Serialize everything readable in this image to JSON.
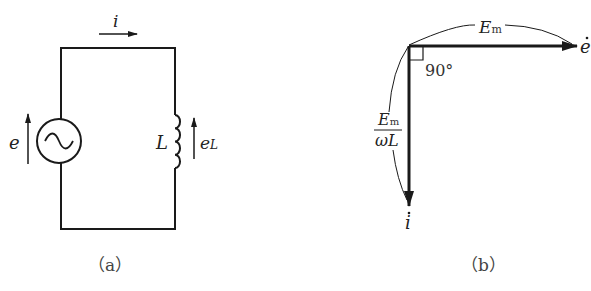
{
  "figure": {
    "panel_a": {
      "caption": "（a）",
      "current_label": "i",
      "source_label": "e",
      "inductor_label": "L",
      "inductor_emf_label": "e",
      "inductor_emf_subscript": "L",
      "source_symbol": "ac-voltage-source"
    },
    "panel_b": {
      "caption": "（b）",
      "horizontal_phasor_label": "e",
      "vertical_phasor_label": "i",
      "horizontal_magnitude_label": "E",
      "horizontal_magnitude_subscript": "m",
      "vertical_magnitude_numerator": "E",
      "vertical_magnitude_numerator_subscript": "m",
      "vertical_magnitude_denominator": "ωL",
      "angle_label": "90°"
    },
    "colors": {
      "line": "#1a1a1a",
      "text": "#222222",
      "background": "#ffffff"
    }
  }
}
